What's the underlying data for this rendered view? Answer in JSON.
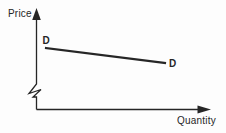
{
  "figure": {
    "y_axis_label": "Price",
    "x_axis_label": "Quantity",
    "ink_color": "#262626",
    "background_color": "#fdfdfd"
  },
  "chart_data": {
    "type": "line",
    "title": "",
    "xlabel": "Quantity",
    "ylabel": "Price",
    "grid": false,
    "legend": "none",
    "axis_ticks": "none",
    "y_axis_break": true,
    "series": [
      {
        "name": "D",
        "endpoint_labels": [
          "D",
          "D"
        ],
        "shape": "straight line, slight downward slope left to right",
        "points_px": [
          [
            46,
            48
          ],
          [
            165,
            63
          ]
        ]
      }
    ]
  }
}
